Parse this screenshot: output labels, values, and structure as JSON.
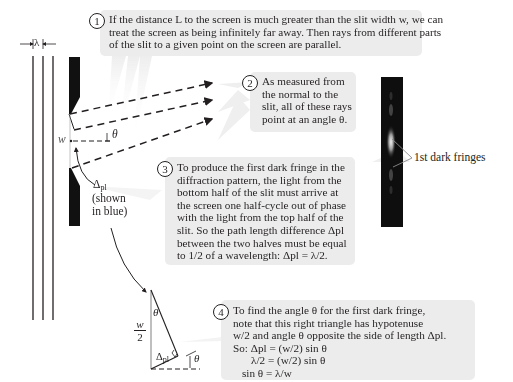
{
  "callouts": [
    {
      "number": "1",
      "lines": [
        "If the distance L to the screen is much greater than the slit width w, we can",
        "treat the screen as being infinitely far away. Then rays from different parts",
        "of the slit to a given point on the screen are parallel."
      ]
    },
    {
      "number": "2",
      "lines": [
        "As measured from",
        "the normal to the",
        "slit, all of these rays",
        "point at an angle θ."
      ]
    },
    {
      "number": "3",
      "lines": [
        "To produce the first dark fringe in the",
        "diffraction pattern, the light from the",
        "bottom half of the slit must arrive at",
        "the screen one half-cycle out of phase",
        "with the light from the top half of the",
        "slit. So the path length difference Δpl",
        "between the two halves must be equal",
        "to 1/2 of a wavelength: Δpl = λ/2."
      ]
    },
    {
      "number": "4",
      "lines": [
        "To find the angle θ for the first dark fringe,",
        "note that this right triangle has hypotenuse",
        "w/2 and angle θ opposite the side of length Δpl.",
        "So:  Δpl = (w/2) sin θ",
        "λ/2 = (w/2) sin θ",
        "sin θ = λ/w"
      ]
    }
  ],
  "labels": {
    "lambda": "λ",
    "w": "w",
    "theta": "θ",
    "delta_pl": "Δ",
    "delta_sub": "pl",
    "shown_in_blue_1": "(shown",
    "shown_in_blue_2": "in blue)",
    "dark_fringes": "1st dark fringes",
    "w_over_2_num": "w",
    "w_over_2_den": "2",
    "triangle_theta": "θ",
    "triangle_delta": "Δ",
    "triangle_delta_sub": "pl",
    "triangle_angle": "θ"
  },
  "colors": {
    "callout_bg": "#ececec",
    "ink": "#231f20",
    "screen": "#111111",
    "fringe_glow": "#d8d8d8"
  }
}
